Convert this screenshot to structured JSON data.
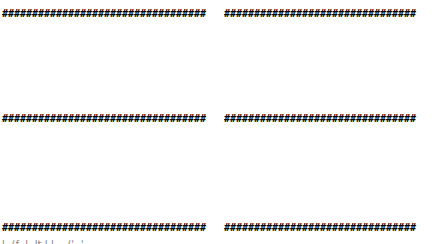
{
  "rows": [
    {
      "left": "##################################",
      "right": "################################"
    },
    {
      "left": "##################################",
      "right": "################################"
    },
    {
      "left": "##################################",
      "right": "################################"
    }
  ],
  "clipped_footer": "l- (f- l-                 lt l-l --            ('-         '"
}
